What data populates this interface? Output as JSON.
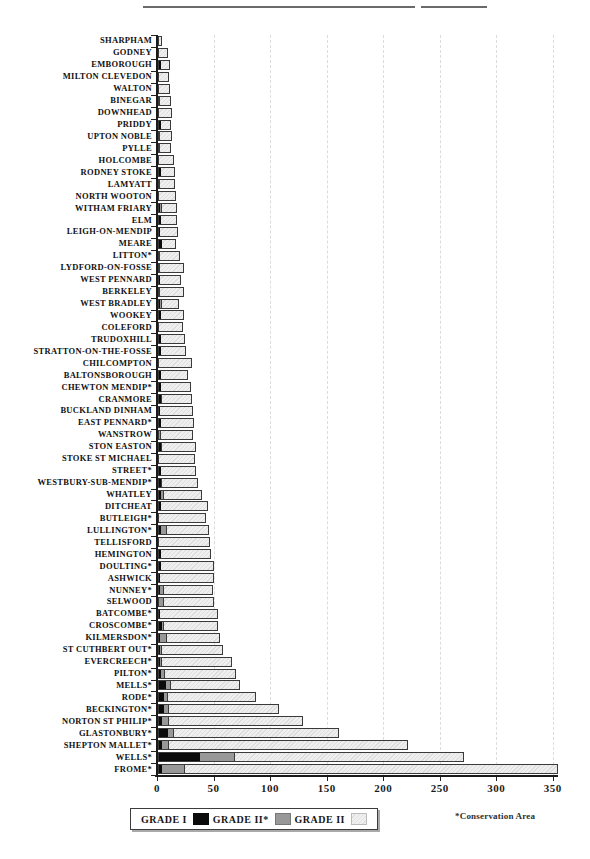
{
  "legend": {
    "items": [
      {
        "label": "GRADE I",
        "color": "#0b0b0b",
        "style": "solid-black"
      },
      {
        "label": "GRADE II*",
        "color": "#989898",
        "style": "solid-gray"
      },
      {
        "label": "GRADE II",
        "color": "#ededed",
        "style": "light-hatched"
      }
    ]
  },
  "note": "*Conservation Area",
  "chart_data": {
    "type": "bar",
    "orientation": "horizontal",
    "stacked": true,
    "title": "",
    "xlabel": "",
    "ylabel": "",
    "xlim": [
      0,
      350
    ],
    "xticks": [
      0,
      50,
      100,
      150,
      200,
      250,
      300,
      350
    ],
    "grid": "vertical-dashed-at-major-ticks",
    "legend_position": "bottom",
    "footnote": "*Conservation Area",
    "categories": [
      "SHARPHAM",
      "GODNEY",
      "EMBOROUGH",
      "MILTON CLEVEDON",
      "WALTON",
      "BINEGAR",
      "DOWNHEAD",
      "PRIDDY",
      "UPTON NOBLE",
      "PYLLE",
      "HOLCOMBE",
      "RODNEY STOKE",
      "LAMYATT",
      "NORTH WOOTON",
      "WITHAM FRIARY",
      "ELM",
      "LEIGH-ON-MENDIP",
      "MEARE",
      "LITTON*",
      "LYDFORD-ON-FOSSE",
      "WEST PENNARD",
      "BERKELEY",
      "WEST BRADLEY",
      "WOOKEY",
      "COLEFORD",
      "TRUDOXHILL",
      "STRATTON-ON-THE-FOSSE",
      "CHILCOMPTON",
      "BALTONSBOROUGH",
      "CHEWTON MENDIP*",
      "CRANMORE",
      "BUCKLAND DINHAM",
      "EAST PENNARD*",
      "WANSTROW",
      "STON EASTON",
      "STOKE ST MICHAEL",
      "STREET*",
      "WESTBURY-SUB-MENDIP*",
      "WHATLEY",
      "DITCHEAT",
      "BUTLEIGH*",
      "LULLINGTON*",
      "TELLISFORD",
      "HEMINGTON",
      "DOULTING*",
      "ASHWICK",
      "NUNNEY*",
      "SELWOOD",
      "BATCOMBE*",
      "CROSCOMBE*",
      "KILMERSDON*",
      "ST CUTHBERT OUT*",
      "EVERCREECH*",
      "PILTON*",
      "MELLS*",
      "RODE*",
      "BECKINGTON*",
      "NORTON ST PHILIP*",
      "GLASTONBURY*",
      "SHEPTON MALLET*",
      "WELLS*",
      "FROME*"
    ],
    "series": [
      {
        "name": "GRADE I",
        "values": [
          0,
          0,
          2,
          0,
          0,
          0,
          0,
          2,
          0,
          0,
          0,
          2,
          0,
          0,
          1,
          2,
          1,
          3,
          0,
          0,
          1,
          0,
          1,
          2,
          0,
          2,
          2,
          0,
          2,
          2,
          2,
          1,
          2,
          0,
          2,
          0,
          2,
          2,
          2,
          2,
          0,
          2,
          0,
          2,
          2,
          1,
          1,
          0,
          1,
          3,
          1,
          1,
          1,
          2,
          6,
          4,
          4,
          3,
          8,
          3,
          36,
          3
        ]
      },
      {
        "name": "GRADE II*",
        "values": [
          0,
          0,
          0,
          0,
          0,
          1,
          0,
          0,
          1,
          1,
          0,
          0,
          1,
          0,
          2,
          0,
          0,
          0,
          1,
          1,
          0,
          1,
          2,
          0,
          0,
          0,
          0,
          0,
          0,
          0,
          1,
          0,
          0,
          2,
          1,
          0,
          0,
          1,
          2,
          0,
          0,
          5,
          0,
          0,
          0,
          0,
          3,
          4,
          0,
          1,
          6,
          2,
          2,
          3,
          5,
          4,
          5,
          6,
          5,
          6,
          31,
          20
        ]
      },
      {
        "name": "GRADE II",
        "values": [
          2,
          7,
          7,
          8,
          9,
          9,
          11,
          8,
          10,
          9,
          12,
          11,
          12,
          14,
          12,
          13,
          15,
          11,
          17,
          20,
          18,
          20,
          14,
          19,
          20,
          20,
          21,
          28,
          23,
          25,
          25,
          28,
          28,
          27,
          29,
          31,
          30,
          31,
          33,
          40,
          41,
          36,
          44,
          43,
          46,
          47,
          43,
          44,
          50,
          47,
          46,
          53,
          61,
          62,
          60,
          77,
          96,
          117,
          145,
          210,
          202,
          329
        ]
      }
    ]
  }
}
